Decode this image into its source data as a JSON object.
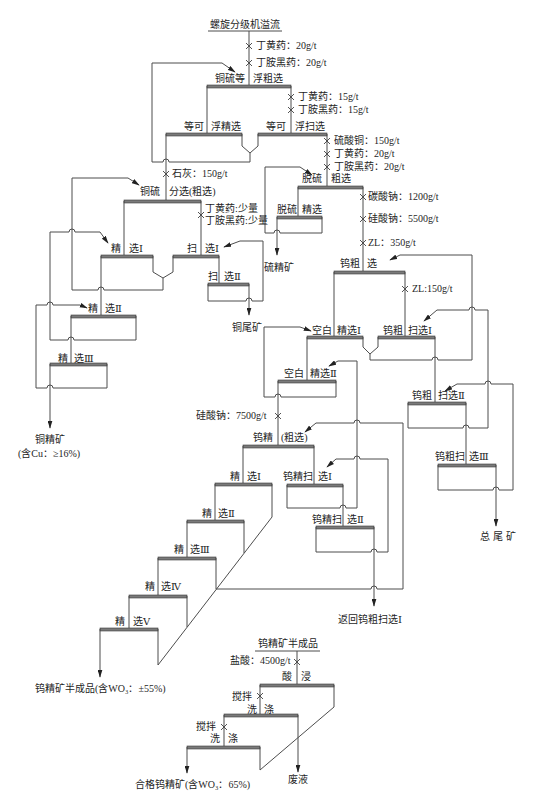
{
  "diagram": {
    "feed": "螺旋分级机溢流",
    "reagents": {
      "feed_xanthate": "丁黄药：20g/t",
      "feed_aerofloat": "丁胺黑药：20g/t",
      "scav_xanthate": "丁黄药：15g/t",
      "scav_aerofloat": "丁胺黑药：15g/t",
      "desulf_cuso4": "硫酸铜：150g/t",
      "desulf_xanthate": "丁黄药：20g/t",
      "desulf_aerofloat": "丁胺黑药：20g/t",
      "lime": "石灰：150g/t",
      "cuscav_xanthate": "丁黄药:少量",
      "cuscav_aerofloat": "丁胺黑药:少量",
      "soda_ash": "碳酸钠：1200g/t",
      "water_glass_1": "硅酸钠：5500g/t",
      "zl_350": "ZL：350g/t",
      "zl_150": "ZL:150g/t",
      "water_glass_2": "硅酸钠：7500g/t",
      "hcl": "盐酸：4500g/t",
      "stir_1": "搅拌",
      "stir_2": "搅拌"
    },
    "cells": {
      "cu_rougher": {
        "a": "铜硫等",
        "b": "浮粗选"
      },
      "cu_cleaner": {
        "a": "等可",
        "b": "浮精选"
      },
      "cu_scavenger": {
        "a": "等可",
        "b": "浮扫选"
      },
      "cus_separation": {
        "a": "铜硫",
        "b": "分选(粗选)"
      },
      "desulf_rougher": {
        "a": "脱硫",
        "b": "粗选"
      },
      "desulf_cleaner": {
        "a": "脱硫",
        "b": "精选"
      },
      "cu_cleaner_1": {
        "a": "精",
        "b": "选Ⅰ"
      },
      "cu_scav_1": {
        "a": "扫",
        "b": "选Ⅰ"
      },
      "cu_scav_2": {
        "a": "扫",
        "b": "选Ⅱ"
      },
      "cu_cleaner_2": {
        "a": "精",
        "b": "选Ⅱ"
      },
      "cu_cleaner_3": {
        "a": "精",
        "b": "选Ⅲ"
      },
      "w_rougher": {
        "a": "钨粗",
        "b": "选"
      },
      "blank_cleaner_1": {
        "a": "空白",
        "b": "精选Ⅰ"
      },
      "w_rough_scav_1": {
        "a": "钨粗",
        "b": "扫选Ⅰ"
      },
      "blank_cleaner_2": {
        "a": "空白",
        "b": "精选Ⅱ"
      },
      "w_rough_scav_2": {
        "a": "钨粗",
        "b": "扫选Ⅱ"
      },
      "w_rough_scav_3": {
        "a": "钨粗扫",
        "b": "选Ⅲ"
      },
      "w_conc_rougher": {
        "a": "钨精",
        "b": "(粗选)"
      },
      "w_cleaner_1": {
        "a": "精",
        "b": "选Ⅰ"
      },
      "w_conc_scav_1": {
        "a": "钨精扫",
        "b": "选Ⅰ"
      },
      "w_cleaner_2": {
        "a": "精",
        "b": "选Ⅱ"
      },
      "w_conc_scav_2": {
        "a": "钨精扫",
        "b": "选Ⅱ"
      },
      "w_cleaner_3": {
        "a": "精",
        "b": "选Ⅲ"
      },
      "w_cleaner_4": {
        "a": "精",
        "b": "选Ⅳ"
      },
      "w_cleaner_5": {
        "a": "精",
        "b": "选Ⅴ"
      },
      "acid_leach": {
        "a": "酸",
        "b": "浸"
      },
      "wash_1": {
        "a": "洗",
        "b": "涤"
      },
      "wash_2": {
        "a": "洗",
        "b": "涤"
      }
    },
    "products": {
      "sulfur_concentrate": "硫精矿",
      "copper_tailings": "铜尾矿",
      "copper_concentrate": "铜精矿",
      "copper_grade": "(含Cu：≥16%)",
      "total_tailings": "总尾矿",
      "return_to": "返回钨粗扫选Ⅰ",
      "w_semi_product": "钨精矿半成品(含WO₃：±55%)",
      "w_semi_header": "钨精矿半成品",
      "waste_liquor": "废液",
      "final_w_concentrate": "合格钨精矿(含WO₃：65%)"
    }
  }
}
